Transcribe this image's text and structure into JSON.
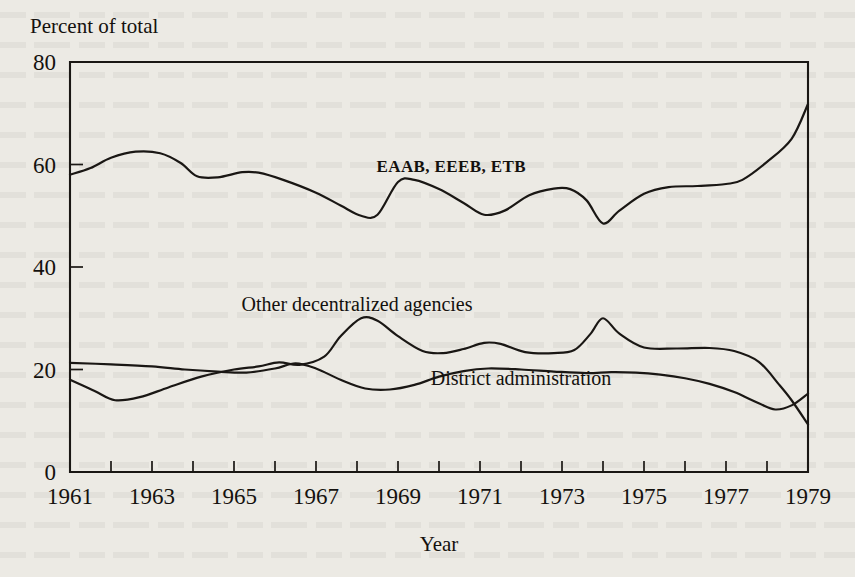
{
  "chart_data": {
    "type": "line",
    "title": "",
    "ylabel": "Percent of total",
    "xlabel": "Year",
    "xlim": [
      1961,
      1979
    ],
    "ylim": [
      0,
      80
    ],
    "yticks": [
      0,
      20,
      40,
      60,
      80
    ],
    "ytick_labels": [
      "0",
      "20",
      "40",
      "60",
      "80"
    ],
    "xticks": [
      1961,
      1962,
      1963,
      1964,
      1965,
      1966,
      1967,
      1968,
      1969,
      1970,
      1971,
      1972,
      1973,
      1974,
      1975,
      1976,
      1977,
      1978,
      1979
    ],
    "xtick_labels_shown": [
      "1961",
      "1963",
      "1965",
      "1967",
      "1969",
      "1971",
      "1973",
      "1975",
      "1977",
      "1979"
    ],
    "grid": false,
    "legend_position": "inline-annotations",
    "x": [
      1961,
      1962,
      1963,
      1964,
      1965,
      1966,
      1967,
      1968,
      1969,
      1970,
      1971,
      1972,
      1973,
      1974,
      1975,
      1976,
      1977,
      1978,
      1979
    ],
    "series": [
      {
        "name": "EAAB, EEEB, ETB",
        "label_x": 1970.3,
        "label_y": 58.5,
        "values": [
          58.0,
          61.5,
          62.5,
          60.0,
          57.7,
          58.5,
          57.5,
          55.3,
          52.3,
          50.2,
          55.8,
          56.0,
          54.5,
          50.0,
          54.0,
          55.5,
          54.8,
          48.5,
          54.0
        ]
      },
      {
        "name": "Other decentralized agencies",
        "label_x": 1968.0,
        "label_y": 31.5,
        "values": [
          18.0,
          15.5,
          14.0,
          15.5,
          17.5,
          19.5,
          21.5,
          20.8,
          24.5,
          29.8,
          26.5,
          23.3,
          23.5,
          25.0,
          23.5,
          24.2,
          30.0,
          24.5,
          24.0
        ]
      },
      {
        "name": "District administration",
        "label_x": 1972.0,
        "label_y": 17.0,
        "values": [
          21.3,
          21.0,
          20.7,
          20.3,
          19.7,
          19.2,
          19.5,
          21.0,
          19.2,
          16.5,
          16.0,
          17.3,
          19.3,
          20.2,
          20.0,
          19.7,
          19.3,
          19.0,
          19.0
        ]
      }
    ],
    "series_detailed_points": {
      "EAAB, EEEB, ETB": [
        [
          1961.0,
          58.0
        ],
        [
          1961.5,
          59.3
        ],
        [
          1962.0,
          61.3
        ],
        [
          1962.6,
          62.5
        ],
        [
          1963.2,
          62.2
        ],
        [
          1963.7,
          60.3
        ],
        [
          1964.1,
          57.7
        ],
        [
          1964.6,
          57.5
        ],
        [
          1965.2,
          58.5
        ],
        [
          1965.6,
          58.4
        ],
        [
          1966.2,
          57.0
        ],
        [
          1967.0,
          54.5
        ],
        [
          1967.6,
          52.0
        ],
        [
          1968.1,
          50.0
        ],
        [
          1968.5,
          50.2
        ],
        [
          1969.0,
          56.6
        ],
        [
          1969.4,
          57.0
        ],
        [
          1970.0,
          55.2
        ],
        [
          1970.6,
          52.5
        ],
        [
          1971.1,
          50.2
        ],
        [
          1971.6,
          51.0
        ],
        [
          1972.2,
          54.0
        ],
        [
          1972.8,
          55.3
        ],
        [
          1973.2,
          55.2
        ],
        [
          1973.6,
          53.0
        ],
        [
          1974.0,
          48.5
        ],
        [
          1974.4,
          51.0
        ],
        [
          1975.0,
          54.3
        ],
        [
          1975.6,
          55.6
        ],
        [
          1976.3,
          55.8
        ],
        [
          1977.0,
          56.2
        ],
        [
          1977.4,
          57.0
        ],
        [
          1978.0,
          60.5
        ],
        [
          1978.6,
          65.0
        ],
        [
          1979.0,
          71.8
        ]
      ],
      "Other decentralized agencies": [
        [
          1961.0,
          18.0
        ],
        [
          1961.6,
          15.8
        ],
        [
          1962.1,
          14.0
        ],
        [
          1962.7,
          14.6
        ],
        [
          1963.4,
          16.5
        ],
        [
          1964.2,
          18.6
        ],
        [
          1965.0,
          20.0
        ],
        [
          1965.6,
          20.6
        ],
        [
          1966.1,
          21.4
        ],
        [
          1966.6,
          20.9
        ],
        [
          1967.2,
          22.5
        ],
        [
          1967.6,
          26.5
        ],
        [
          1968.1,
          30.0
        ],
        [
          1968.5,
          29.5
        ],
        [
          1969.0,
          26.5
        ],
        [
          1969.6,
          23.6
        ],
        [
          1970.1,
          23.2
        ],
        [
          1970.6,
          24.0
        ],
        [
          1971.1,
          25.2
        ],
        [
          1971.5,
          25.0
        ],
        [
          1972.1,
          23.4
        ],
        [
          1972.8,
          23.2
        ],
        [
          1973.3,
          23.8
        ],
        [
          1973.7,
          27.0
        ],
        [
          1974.0,
          30.0
        ],
        [
          1974.4,
          27.0
        ],
        [
          1975.0,
          24.3
        ],
        [
          1975.8,
          24.1
        ],
        [
          1976.6,
          24.2
        ],
        [
          1977.2,
          23.6
        ],
        [
          1977.8,
          21.5
        ],
        [
          1978.3,
          17.0
        ],
        [
          1978.6,
          14.0
        ],
        [
          1979.0,
          9.3
        ]
      ],
      "District administration": [
        [
          1961.0,
          21.3
        ],
        [
          1962.0,
          21.0
        ],
        [
          1963.0,
          20.6
        ],
        [
          1963.8,
          20.0
        ],
        [
          1964.6,
          19.6
        ],
        [
          1965.3,
          19.4
        ],
        [
          1966.0,
          20.2
        ],
        [
          1966.5,
          21.2
        ],
        [
          1967.0,
          20.2
        ],
        [
          1967.6,
          18.0
        ],
        [
          1968.2,
          16.3
        ],
        [
          1968.8,
          16.1
        ],
        [
          1969.4,
          17.0
        ],
        [
          1970.0,
          18.6
        ],
        [
          1970.6,
          19.7
        ],
        [
          1971.2,
          20.2
        ],
        [
          1972.0,
          20.0
        ],
        [
          1972.8,
          19.6
        ],
        [
          1973.6,
          19.3
        ],
        [
          1974.2,
          19.5
        ],
        [
          1974.8,
          19.4
        ],
        [
          1975.4,
          19.0
        ],
        [
          1976.0,
          18.3
        ],
        [
          1976.6,
          17.2
        ],
        [
          1977.2,
          15.6
        ],
        [
          1977.8,
          13.4
        ],
        [
          1978.2,
          12.2
        ],
        [
          1978.6,
          13.0
        ],
        [
          1979.0,
          15.3
        ]
      ]
    }
  },
  "axes": {
    "y_axis_title": "Percent of total",
    "x_axis_title": "Year"
  }
}
